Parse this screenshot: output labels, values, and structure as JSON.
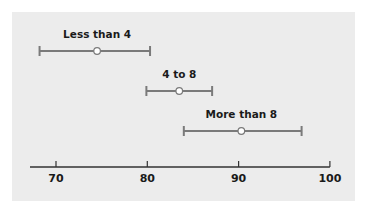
{
  "chart_data": {
    "type": "interval",
    "title": "",
    "xlabel": "",
    "ylabel": "",
    "xlim": [
      67,
      100
    ],
    "x_ticks": [
      70,
      80,
      90,
      100
    ],
    "x_tick_labels": [
      "70",
      "80",
      "90",
      "100"
    ],
    "grid": false,
    "legend": null,
    "series": [
      {
        "name": "Less than 4",
        "low": 68.2,
        "center": 74.5,
        "high": 80.3
      },
      {
        "name": "4 to 8",
        "low": 79.9,
        "center": 83.5,
        "high": 87.1
      },
      {
        "name": "More than 8",
        "low": 84.0,
        "center": 90.3,
        "high": 96.9
      }
    ]
  },
  "colors": {
    "panel_bg": "#ececec",
    "interval_line": "#7a7a7a",
    "axis": "#333333",
    "marker_fill": "#ffffff"
  }
}
